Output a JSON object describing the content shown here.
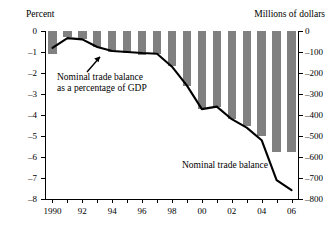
{
  "chart_data": {
    "type": "bar",
    "title": "",
    "subtitle": "",
    "xlabel": "",
    "ylabel": "Percent",
    "ylabel_right": "Millions of dollars",
    "grid": false,
    "legend_position": "inline-annotations",
    "x": [
      1990,
      1991,
      1992,
      1993,
      1994,
      1995,
      1996,
      1997,
      1998,
      1999,
      2000,
      2001,
      2002,
      2003,
      2004,
      2005,
      2006
    ],
    "categories": [
      "1990",
      "1991",
      "1992",
      "1993",
      "1994",
      "1995",
      "1996",
      "1997",
      "1998",
      "1999",
      "2000",
      "2001",
      "2002",
      "2003",
      "2004",
      "2005",
      "2006"
    ],
    "xtick_labels": [
      "1990",
      "92",
      "94",
      "96",
      "98",
      "00",
      "02",
      "04",
      "06"
    ],
    "xtick_values": [
      1990,
      1992,
      1994,
      1996,
      1998,
      2000,
      2002,
      2004,
      2006
    ],
    "xlim": [
      1989.5,
      2006.5
    ],
    "ylim_left": [
      -8,
      0
    ],
    "ylim_right": [
      -800,
      0
    ],
    "ytick_labels_left": [
      "0",
      "–1",
      "–2",
      "–3",
      "–4",
      "–5",
      "–6",
      "–7",
      "–8"
    ],
    "ytick_values_left": [
      0,
      -1,
      -2,
      -3,
      -4,
      -5,
      -6,
      -7,
      -8
    ],
    "ytick_labels_right": [
      "0",
      "–100",
      "–200",
      "–300",
      "–400",
      "–500",
      "–600",
      "–700",
      "–800"
    ],
    "ytick_values_right": [
      0,
      -100,
      -200,
      -300,
      -400,
      -500,
      -600,
      -700,
      -800
    ],
    "series": [
      {
        "name": "Nominal trade balance",
        "render": "bar",
        "axis": "right",
        "units": "Millions of dollars",
        "color": "#808080",
        "values": [
          -110,
          -30,
          -40,
          -75,
          -100,
          -105,
          -112,
          -110,
          -168,
          -262,
          -372,
          -360,
          -420,
          -452,
          -500,
          -575,
          -578
        ]
      },
      {
        "name": "Nominal trade balance as a percentage of GDP",
        "render": "line",
        "axis": "left",
        "units": "Percent",
        "color": "#000000",
        "values": [
          -0.8,
          -0.34,
          -0.4,
          -0.76,
          -0.95,
          -1.0,
          -1.05,
          -1.08,
          -1.7,
          -2.6,
          -3.72,
          -3.6,
          -4.2,
          -4.6,
          -5.2,
          -7.1,
          -7.58
        ]
      }
    ],
    "annotations": [
      {
        "name": "gdp-share-annotation",
        "line1": "Nominal trade balance",
        "line2": "as a percentage of GDP",
        "has_arrow": true,
        "points_to_year": 1993.7
      },
      {
        "name": "trade-balance-annotation",
        "line1": "Nominal trade balance",
        "has_arrow": false
      }
    ]
  },
  "axes": {
    "left_title": "Percent",
    "right_title": "Millions of dollars"
  },
  "annotations": {
    "gdp_line1": "Nominal trade balance",
    "gdp_line2": "as a percentage of GDP",
    "balance_label": "Nominal trade balance"
  },
  "colors": {
    "bar": "#808080",
    "line": "#000000",
    "axis": "#000000",
    "background": "#ffffff"
  }
}
